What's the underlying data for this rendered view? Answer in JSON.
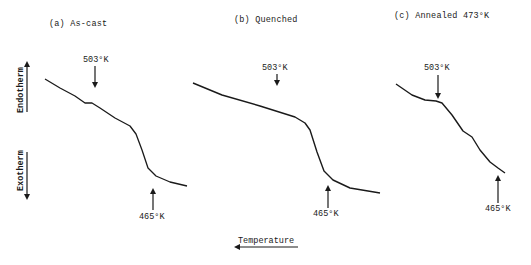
{
  "chart_data": {
    "type": "line",
    "xlabel": "Temperature",
    "xlabel_direction": "left (increasing)",
    "ylabel_up": "Endotherm",
    "ylabel_down": "Exotherm",
    "grid": false,
    "panels": [
      {
        "id": "a",
        "title": "(a) As-cast",
        "annotations": [
          {
            "label": "503°K",
            "arrow": "down",
            "position": "upper"
          },
          {
            "label": "465°K",
            "arrow": "up",
            "position": "lower"
          }
        ],
        "curve_points_px": [
          [
            45,
            79
          ],
          [
            60,
            88
          ],
          [
            75,
            96
          ],
          [
            85,
            103
          ],
          [
            92,
            103
          ],
          [
            100,
            108
          ],
          [
            115,
            118
          ],
          [
            130,
            126
          ],
          [
            136,
            134
          ],
          [
            142,
            150
          ],
          [
            148,
            168
          ],
          [
            156,
            176
          ],
          [
            170,
            182
          ],
          [
            187,
            186
          ]
        ]
      },
      {
        "id": "b",
        "title": "(b) Quenched",
        "annotations": [
          {
            "label": "503°K",
            "arrow": "down",
            "position": "upper"
          },
          {
            "label": "465°K",
            "arrow": "up",
            "position": "lower"
          }
        ],
        "curve_points_px": [
          [
            193,
            83
          ],
          [
            222,
            95
          ],
          [
            260,
            106
          ],
          [
            295,
            117
          ],
          [
            305,
            123
          ],
          [
            310,
            130
          ],
          [
            317,
            152
          ],
          [
            324,
            171
          ],
          [
            333,
            180
          ],
          [
            350,
            188
          ],
          [
            368,
            191
          ],
          [
            380,
            193
          ]
        ]
      },
      {
        "id": "c",
        "title": "(c) Annealed 473°K",
        "annotations": [
          {
            "label": "503°K",
            "arrow": "down",
            "position": "upper"
          },
          {
            "label": "465°K",
            "arrow": "up",
            "position": "lower"
          }
        ],
        "curve_points_px": [
          [
            396,
            84
          ],
          [
            412,
            95
          ],
          [
            425,
            100
          ],
          [
            436,
            101
          ],
          [
            442,
            103
          ],
          [
            452,
            115
          ],
          [
            463,
            131
          ],
          [
            472,
            137
          ],
          [
            480,
            150
          ],
          [
            490,
            162
          ],
          [
            498,
            168
          ],
          [
            505,
            173
          ]
        ]
      }
    ]
  },
  "labels": {
    "panel_a": "(a) As-cast",
    "panel_b": "(b) Quenched",
    "panel_c": "(c) Annealed 473°K",
    "a_upper": "503°K",
    "a_lower": "465°K",
    "b_upper": "503°K",
    "b_lower": "465°K",
    "c_upper": "503°K",
    "c_lower": "465°K",
    "endotherm": "Endotherm",
    "exotherm": "Exotherm",
    "temperature": "Temperature"
  }
}
